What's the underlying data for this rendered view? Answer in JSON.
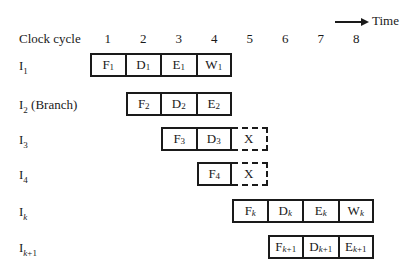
{
  "header": {
    "time_label": "Time",
    "clock_label": "Clock cycle",
    "cycles": [
      "1",
      "2",
      "3",
      "4",
      "5",
      "6",
      "7",
      "8"
    ]
  },
  "rows": [
    {
      "label": "I",
      "sub": "1",
      "suffix": "",
      "start": 1,
      "stages": [
        {
          "s": "F",
          "sub": "1"
        },
        {
          "s": "D",
          "sub": "1"
        },
        {
          "s": "E",
          "sub": "1"
        },
        {
          "s": "W",
          "sub": "1"
        }
      ],
      "flushed": false
    },
    {
      "label": "I",
      "sub": "2",
      "suffix": " (Branch)",
      "start": 2,
      "stages": [
        {
          "s": "F",
          "sub": "2"
        },
        {
          "s": "D",
          "sub": "2"
        },
        {
          "s": "E",
          "sub": "2"
        }
      ],
      "flushed": false
    },
    {
      "label": "I",
      "sub": "3",
      "suffix": "",
      "start": 3,
      "stages": [
        {
          "s": "F",
          "sub": "3"
        },
        {
          "s": "D",
          "sub": "3"
        }
      ],
      "flushed": true,
      "flush_mark": "X"
    },
    {
      "label": "I",
      "sub": "4",
      "suffix": "",
      "start": 4,
      "stages": [
        {
          "s": "F",
          "sub": "4"
        }
      ],
      "flushed": true,
      "flush_mark": "X"
    },
    {
      "label": "I",
      "sub": "k",
      "suffix": "",
      "start": 5,
      "stages": [
        {
          "s": "F",
          "sub": "k"
        },
        {
          "s": "D",
          "sub": "k"
        },
        {
          "s": "E",
          "sub": "k"
        },
        {
          "s": "W",
          "sub": "k"
        }
      ],
      "flushed": false
    },
    {
      "label": "I",
      "sub": "k+1",
      "suffix": "",
      "start": 6,
      "stages": [
        {
          "s": "F",
          "sub": "k+1"
        },
        {
          "s": "D",
          "sub": "k+1"
        },
        {
          "s": "E",
          "sub": "k+1"
        }
      ],
      "flushed": false
    }
  ]
}
